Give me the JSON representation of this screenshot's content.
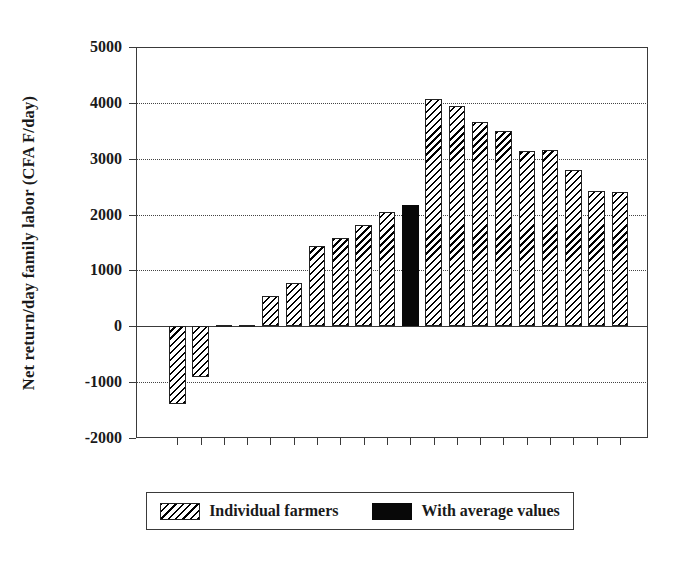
{
  "chart_data": {
    "type": "bar",
    "title": "",
    "xlabel": "",
    "ylabel": "Net return/day family labor (CFA F/day)",
    "ylim": [
      -2000,
      5000
    ],
    "ytick_labels": [
      "5000",
      "4000",
      "3000",
      "2000",
      "1000",
      "0",
      "-1000",
      "-2000"
    ],
    "ytick_values": [
      5000,
      4000,
      3000,
      2000,
      1000,
      0,
      -1000,
      -2000
    ],
    "grid": "horizontal dotted at 4000, 3000, 2000, 1000, -1000; solid line at 0",
    "legend_position": "below plot, centered",
    "categories": [
      "1",
      "2",
      "3",
      "4",
      "5",
      "6",
      "7",
      "8",
      "9",
      "10",
      "avg",
      "11",
      "12",
      "13",
      "14",
      "15",
      "16",
      "17",
      "18",
      "19"
    ],
    "values": [
      -1400,
      -900,
      20,
      30,
      545,
      770,
      1430,
      1580,
      1820,
      2050,
      2175,
      4075,
      3940,
      3665,
      3490,
      3130,
      3150,
      2800,
      2420,
      2400
    ],
    "series": [
      {
        "name": "Individual farmers",
        "fill": "hatched",
        "color": "#000000",
        "values": [
          -1400,
          -900,
          20,
          30,
          545,
          770,
          1430,
          1580,
          1820,
          2050,
          null,
          4075,
          3940,
          3665,
          3490,
          3130,
          3150,
          2800,
          2420,
          2400
        ]
      },
      {
        "name": "With average values",
        "fill": "solid",
        "color": "#080808",
        "values": [
          null,
          null,
          null,
          null,
          null,
          null,
          null,
          null,
          null,
          null,
          2175,
          null,
          null,
          null,
          null,
          null,
          null,
          null,
          null,
          null
        ]
      }
    ],
    "bar_count": 20,
    "highlighted_bar_index": 10
  },
  "legend": {
    "items": [
      {
        "label": "Individual farmers",
        "fill": "hatched"
      },
      {
        "label": "With average values",
        "fill": "solid"
      }
    ]
  }
}
